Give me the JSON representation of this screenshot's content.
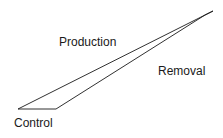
{
  "diagram": {
    "shape": "elongated-quadrilateral-wedge",
    "stroke_color": "#1a1a1a",
    "background": "#ffffff",
    "vertices": {
      "left_tip": [
        18,
        109
      ],
      "base_right": [
        56,
        109
      ],
      "inner_apex": [
        205,
        15
      ],
      "apex": [
        213,
        11
      ]
    },
    "labels": {
      "production": "Production",
      "removal": "Removal",
      "control": "Control"
    }
  }
}
